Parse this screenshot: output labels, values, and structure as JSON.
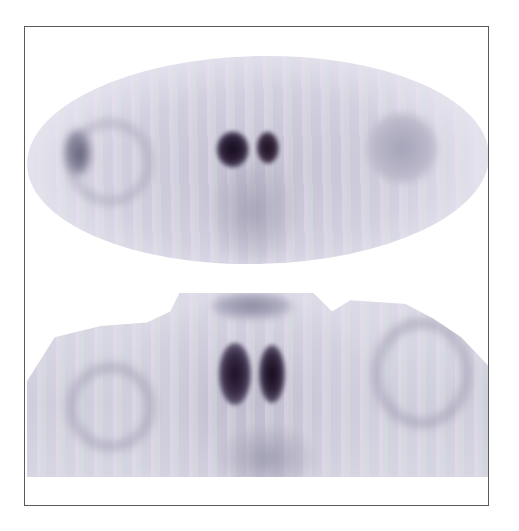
{
  "figure": {
    "type": "scintigraphy",
    "panels": [
      {
        "id": "top",
        "description": "early-phase scan, elliptical field of view, dense central uptake"
      },
      {
        "id": "bottom",
        "description": "delayed-phase scan, neck and shoulders, bilateral thyroid-lobe uptake"
      }
    ]
  },
  "colors": {
    "frame_border": "#5a5a5a",
    "background": "#ffffff",
    "soft_tissue": "#cfcddc",
    "hot_spot": "#1a1024"
  }
}
